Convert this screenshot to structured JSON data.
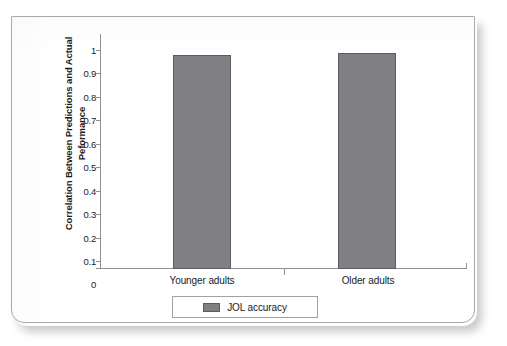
{
  "chart_data": {
    "type": "bar",
    "title": "",
    "subtitle": "",
    "xlabel": "",
    "ylabel": "Correlation Between Predictions and Actual Peformance",
    "categories": [
      "Younger adults",
      "Older adults"
    ],
    "series": [
      {
        "name": "JOL accuracy",
        "values": [
          0.91,
          0.92
        ],
        "color": "#808084"
      }
    ],
    "ylim": [
      0,
      1
    ],
    "ytick_labels": [
      "1",
      "0.9",
      "0.8",
      "0.7",
      "0.6",
      "0.5",
      "0.4",
      "0.3",
      "0.2",
      "0.1",
      "0"
    ],
    "ytick_values": [
      1,
      0.9,
      0.8,
      0.7,
      0.6,
      0.5,
      0.4,
      0.3,
      0.2,
      0.1,
      0
    ],
    "grid": false,
    "legend": {
      "position": "bottom",
      "entries": [
        "JOL accuracy"
      ]
    },
    "axis_color": "#8f8f94",
    "bar_border_color": "#5c5c60",
    "background": "#ffffff"
  }
}
